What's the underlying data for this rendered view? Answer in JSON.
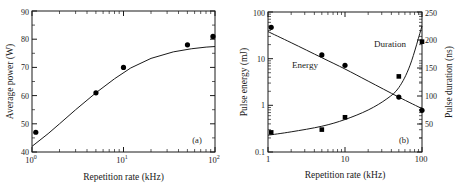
{
  "figure": {
    "background": "#ffffff",
    "ink": "#1a1a1a",
    "marker_color": "#000000"
  },
  "chart_data": [
    {
      "type": "scatter",
      "panel_label": "(a)",
      "title": "",
      "xlabel": "Repetition rate (kHz)",
      "ylabel": "Average power (W)",
      "xscale": "log",
      "yscale": "linear",
      "xlim": [
        1,
        100
      ],
      "ylim": [
        40,
        90
      ],
      "xticks": [
        "10^0",
        "10^1",
        "10^2"
      ],
      "xtick_values": [
        1,
        10,
        100
      ],
      "yticks": [
        "40",
        "50",
        "60",
        "70",
        "80",
        "90"
      ],
      "ytick_values": [
        40,
        50,
        60,
        70,
        80,
        90
      ],
      "grid": false,
      "legend": "none",
      "series": [
        {
          "name": "Average power",
          "marker": "filled-circle",
          "x": [
            1.1,
            5,
            10,
            50,
            95
          ],
          "values": [
            47,
            61,
            70,
            78,
            81
          ]
        },
        {
          "name": "Average power fit",
          "marker": "line",
          "x": [
            1,
            1.5,
            2,
            3,
            5,
            8,
            12,
            20,
            35,
            55,
            80,
            100
          ],
          "values": [
            42,
            46.5,
            50,
            55,
            61,
            66,
            69.8,
            73.2,
            75.5,
            76.6,
            77.2,
            77.4
          ]
        }
      ]
    },
    {
      "type": "scatter",
      "panel_label": "(b)",
      "title": "",
      "xlabel": "Repetition rate (kHz)",
      "ylabel": "Pulse energy (mJ)",
      "ylabel_right": "Pulse duration (ns)",
      "xscale": "log",
      "yscale": "log",
      "yscale_right": "linear",
      "xlim": [
        1,
        100
      ],
      "ylim": [
        0.1,
        100
      ],
      "ylim_right": [
        0,
        250
      ],
      "xticks": [
        "1",
        "10",
        "100"
      ],
      "xtick_values": [
        1,
        10,
        100
      ],
      "yticks": [
        "0.1",
        "1",
        "10",
        "100"
      ],
      "ytick_values": [
        0.1,
        1,
        10,
        100
      ],
      "yticks_right": [
        "50",
        "100",
        "150",
        "200",
        "250"
      ],
      "ytick_values_right": [
        50,
        100,
        150,
        200,
        250
      ],
      "grid": false,
      "annotations": [
        {
          "text": "Energy",
          "x": 3.0,
          "y": 4.0
        },
        {
          "text": "Duration",
          "x": 32,
          "y": 22
        }
      ],
      "series": [
        {
          "name": "Energy",
          "axis": "left",
          "marker": "filled-circle",
          "x": [
            1.1,
            5,
            10,
            50,
            100
          ],
          "values": [
            47,
            12,
            7.2,
            1.5,
            0.78
          ]
        },
        {
          "name": "Energy fit",
          "axis": "left",
          "marker": "line",
          "x": [
            1,
            2,
            5,
            10,
            20,
            50,
            100
          ],
          "values": [
            38,
            22,
            10.5,
            6.0,
            3.3,
            1.5,
            0.85
          ]
        },
        {
          "name": "Duration",
          "axis": "right",
          "marker": "filled-square",
          "x": [
            1.1,
            5,
            10,
            50,
            100
          ],
          "values": [
            35,
            40,
            62,
            135,
            197
          ]
        },
        {
          "name": "Duration fit",
          "axis": "right",
          "marker": "line",
          "x": [
            1,
            2,
            5,
            10,
            20,
            35,
            50,
            70,
            100
          ],
          "values": [
            30,
            36,
            46,
            58,
            75,
            95,
            115,
            155,
            225
          ]
        }
      ]
    }
  ]
}
